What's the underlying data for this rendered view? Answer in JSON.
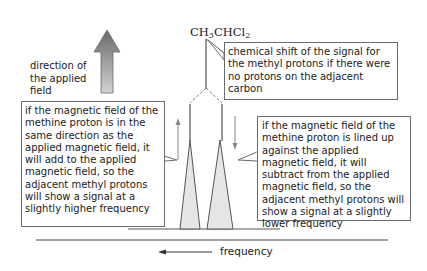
{
  "diagram": {
    "compound": {
      "prefix": "CH",
      "sub1": "3",
      "middle": "CHCl",
      "sub2": "2"
    },
    "field_direction_label": "direction of the applied field",
    "callouts": {
      "chemical_shift": "chemical shift of the signal for the methyl protons if there were no protons on the adjacent carbon",
      "same_direction": "if the magnetic field of the methine proton is in the same direction as the applied magnetic field, it will add to the applied magnetic field, so the adjacent methyl protons will show a signal at a slightly higher frequency",
      "opposite_direction": "if the magnetic field of the methine proton is lined up against the applied magnetic field, it will subtract from the applied magnetic field, so the adjacent methyl protons will show a signal at a slightly lower frequency"
    },
    "axis_label": "frequency",
    "colors": {
      "line": "#555555",
      "peak_fill": "#e6e6e6",
      "arrow_top": "#6a6a6a",
      "arrow_bottom": "#cfcfcf",
      "box_border": "#6b6b6b"
    }
  }
}
